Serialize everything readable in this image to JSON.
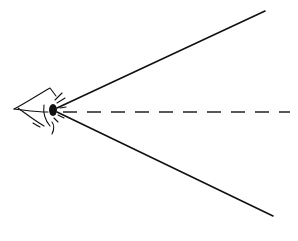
{
  "diagram": {
    "elements": [
      {
        "name": "eye",
        "type": "sketch",
        "position": [
          50,
          110
        ]
      },
      {
        "name": "upper-sight-line",
        "type": "solid-line",
        "from": [
          56,
          108
        ],
        "to": [
          265,
          11
        ]
      },
      {
        "name": "lower-sight-line",
        "type": "solid-line",
        "from": [
          56,
          112
        ],
        "to": [
          273,
          216
        ]
      },
      {
        "name": "center-axis",
        "type": "dashed-line",
        "from": [
          62,
          112
        ],
        "to": [
          290,
          112
        ]
      }
    ],
    "colors": {
      "stroke": "#111111",
      "background": "#ffffff"
    }
  }
}
